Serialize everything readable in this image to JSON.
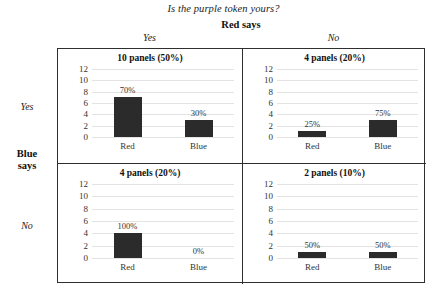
{
  "figure": {
    "title": "Is the purple token yours?",
    "column_group_label": "Red says",
    "row_group_label": "Blue\nsays",
    "row_group_label_line1": "Blue",
    "row_group_label_line2": "says",
    "column_headers": [
      "Yes",
      "No"
    ],
    "row_headers": [
      "Yes",
      "No"
    ]
  },
  "chart_data": {
    "type": "bar",
    "title": "Is the purple token yours?",
    "xlabel": "Red says",
    "ylabel": "Blue says",
    "ylim": [
      0,
      12
    ],
    "yticks": [
      0,
      2,
      4,
      6,
      8,
      10,
      12
    ],
    "grid": true,
    "legend": "none",
    "categories": [
      "Red",
      "Blue"
    ],
    "bar_color": "#2b2b2b",
    "panels": [
      {
        "row": "Yes",
        "column": "Yes",
        "title": "10 panels (50%)",
        "panel_count": 10,
        "panel_share": "50%",
        "categories": [
          "Red",
          "Blue"
        ],
        "values": [
          7,
          3
        ],
        "labels": [
          "70%",
          "30%"
        ]
      },
      {
        "row": "Yes",
        "column": "No",
        "title": "4 panels (20%)",
        "panel_count": 4,
        "panel_share": "20%",
        "categories": [
          "Red",
          "Blue"
        ],
        "values": [
          1,
          3
        ],
        "labels": [
          "25%",
          "75%"
        ]
      },
      {
        "row": "No",
        "column": "Yes",
        "title": "4 panels (20%)",
        "panel_count": 4,
        "panel_share": "20%",
        "categories": [
          "Red",
          "Blue"
        ],
        "values": [
          4,
          0
        ],
        "labels": [
          "100%",
          "0%"
        ]
      },
      {
        "row": "No",
        "column": "No",
        "title": "2 panels (10%)",
        "panel_count": 2,
        "panel_share": "10%",
        "categories": [
          "Red",
          "Blue"
        ],
        "values": [
          1,
          1
        ],
        "labels": [
          "50%",
          "50%"
        ]
      }
    ]
  }
}
